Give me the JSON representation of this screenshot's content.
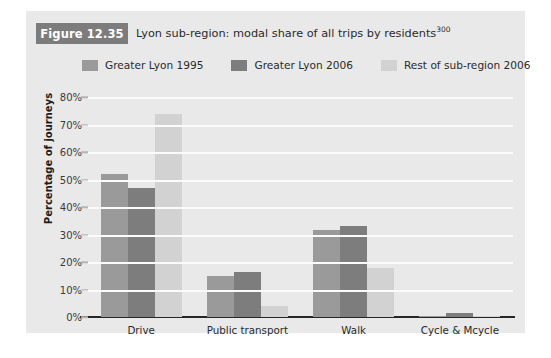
{
  "figure": {
    "badge": "Figure 12.35",
    "title": "Lyon sub-region: modal share of all trips by residents",
    "title_superscript": "300",
    "badge_color": "#7c7c7c",
    "panel_color": "#e9e9e9"
  },
  "chart_data": {
    "type": "bar",
    "title": "Lyon sub-region: modal share of all trips by residents",
    "xlabel": "",
    "ylabel": "Percentage of journeys",
    "ylim": [
      0,
      80
    ],
    "ytick_labels": [
      "0%",
      "10%",
      "20%",
      "30%",
      "40%",
      "50%",
      "60%",
      "70%",
      "80%"
    ],
    "ytick_values": [
      0,
      10,
      20,
      30,
      40,
      50,
      60,
      70,
      80
    ],
    "grid": true,
    "legend_position": "top",
    "categories": [
      "Drive",
      "Public transport",
      "Walk",
      "Cycle & Mcycle"
    ],
    "series": [
      {
        "name": "Greater Lyon 1995",
        "color": "#9a9a9a",
        "values": [
          52,
          15,
          31.5,
          0.3
        ]
      },
      {
        "name": "Greater Lyon 2006",
        "color": "#7d7d7d",
        "values": [
          47,
          16.5,
          33,
          1.5
        ]
      },
      {
        "name": "Rest of sub-region 2006",
        "color": "#d2d2d2",
        "values": [
          74,
          4,
          18,
          0.3
        ]
      }
    ]
  }
}
